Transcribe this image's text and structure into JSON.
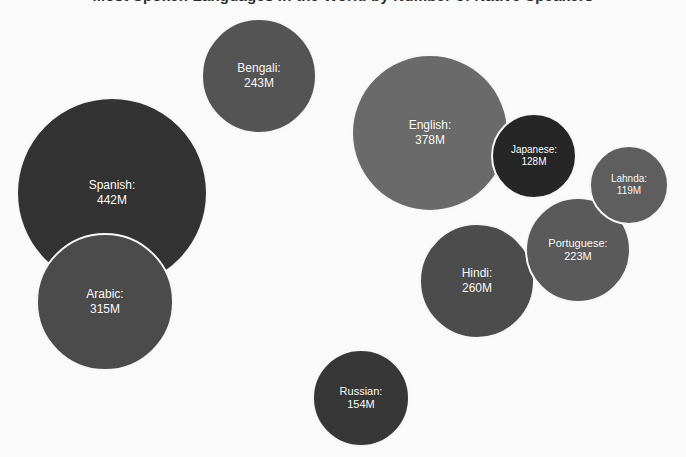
{
  "chart": {
    "title": "Most Spoken Languages in the World by Number of Native Speakers",
    "background_color": "#fafafa",
    "stroke_color": "#f7f7f7",
    "label_color": "#ffffff"
  },
  "chart_data": {
    "type": "bubble",
    "title": "Most Spoken Languages in the World by Number of Native Speakers",
    "xlabel": "",
    "ylabel": "",
    "grid": false,
    "legend": "none",
    "value_unit": "native speakers",
    "size_encoding": "circle area proportional to number of speakers",
    "categories": [
      "Chinese",
      "Spanish",
      "English",
      "Arabic",
      "Hindi",
      "Bengali",
      "Portuguese",
      "Russian",
      "Japanese",
      "Lahnda"
    ],
    "values": [
      1300,
      442,
      378,
      315,
      260,
      243,
      223,
      154,
      128,
      119
    ],
    "value_labels": [
      "1.3B",
      "442M",
      "378M",
      "315M",
      "260M",
      "243M",
      "223M",
      "154M",
      "128M",
      "119M"
    ],
    "bubbles": [
      {
        "name": "chinese",
        "label": "Chinese:",
        "value_label": "1.3B",
        "value": 1300,
        "cx": 293,
        "cy": 260,
        "r": 136,
        "color": "#2c2c2c",
        "font_size": 13
      },
      {
        "name": "spanish",
        "label": "Spanish:",
        "value_label": "442M",
        "value": 442,
        "cx": 112,
        "cy": 193,
        "r": 96,
        "color": "#333333",
        "font_size": 12
      },
      {
        "name": "english",
        "label": "English:",
        "value_label": "378M",
        "value": 378,
        "cx": 430,
        "cy": 133,
        "r": 79,
        "color": "#6a6a6a",
        "font_size": 12
      },
      {
        "name": "arabic",
        "label": "Arabic:",
        "value_label": "315M",
        "value": 315,
        "cx": 105,
        "cy": 302,
        "r": 69,
        "color": "#4b4b4b",
        "font_size": 12
      },
      {
        "name": "hindi",
        "label": "Hindi:",
        "value_label": "260M",
        "value": 260,
        "cx": 477,
        "cy": 281,
        "r": 58,
        "color": "#4c4c4c",
        "font_size": 12
      },
      {
        "name": "bengali",
        "label": "Bengali:",
        "value_label": "243M",
        "value": 243,
        "cx": 259,
        "cy": 76,
        "r": 58,
        "color": "#545454",
        "font_size": 12
      },
      {
        "name": "portuguese",
        "label": "Portuguese:",
        "value_label": "223M",
        "value": 223,
        "cx": 578,
        "cy": 250,
        "r": 53,
        "color": "#5a5a5a",
        "font_size": 11
      },
      {
        "name": "russian",
        "label": "Russian:",
        "value_label": "154M",
        "value": 154,
        "cx": 361,
        "cy": 398,
        "r": 49,
        "color": "#373737",
        "font_size": 11
      },
      {
        "name": "japanese",
        "label": "Japanese:",
        "value_label": "128M",
        "value": 128,
        "cx": 534,
        "cy": 156,
        "r": 43,
        "color": "#262626",
        "font_size": 10
      },
      {
        "name": "lahnda",
        "label": "Lahnda:",
        "value_label": "119M",
        "value": 119,
        "cx": 629,
        "cy": 185,
        "r": 40,
        "color": "#5e5e5e",
        "font_size": 10
      }
    ]
  }
}
